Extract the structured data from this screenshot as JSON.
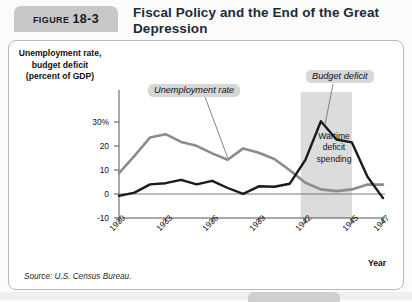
{
  "figure": {
    "badge_word": "FIGURE",
    "badge_number": "18-3",
    "title": "Fiscal Policy and the End of the Great Depression",
    "source": "Source: U.S. Census Bureau."
  },
  "annotations": {
    "unemployment_label": "Unemployment rate",
    "deficit_label": "Budget deficit",
    "band_line1": "Wartime",
    "band_line2": "deficit",
    "band_line3": "spending"
  },
  "colors": {
    "unemployment_line": "#8c8c8c",
    "deficit_line": "#1a1a1a",
    "band_fill": "#dcdcdc",
    "callout_bg": "#d7d7d7",
    "badge_bg": "#c8c8c8",
    "title_text": "#1b2a3a",
    "panel_border": "#b9b9b9",
    "axis": "#555555"
  },
  "chart_data": {
    "type": "line",
    "title": "Fiscal Policy and the End of the Great Depression",
    "xlabel": "Year",
    "ylabel": "Unemployment rate, budget deficit (percent of GDP)",
    "ylabel_lines": [
      "Unemployment rate,",
      "budget deficit",
      "(percent of GDP)"
    ],
    "xlim": [
      1930,
      1947
    ],
    "ylim": [
      -10,
      33
    ],
    "yticks": [
      -10,
      0,
      10,
      20,
      30
    ],
    "ytick_labels": [
      "-10",
      "0",
      "10",
      "20",
      "30%"
    ],
    "xticks": [
      1930,
      1933,
      1936,
      1939,
      1942,
      1945,
      1947
    ],
    "xtick_labels": [
      "1930",
      "1933",
      "1936",
      "1939",
      "1942",
      "1945",
      "1947"
    ],
    "grid": false,
    "legend_position": "inline-annotations",
    "shaded_region": {
      "label": "Wartime deficit spending",
      "x_start": 1941.7,
      "x_end": 1945.0
    },
    "x": [
      1930,
      1931,
      1932,
      1933,
      1934,
      1935,
      1936,
      1937,
      1938,
      1939,
      1940,
      1941,
      1942,
      1943,
      1944,
      1945,
      1946,
      1947
    ],
    "series": [
      {
        "name": "Unemployment rate",
        "color": "#8c8c8c",
        "values": [
          8.7,
          15.9,
          23.6,
          24.9,
          21.7,
          20.1,
          16.9,
          14.3,
          19.0,
          17.2,
          14.6,
          9.9,
          4.7,
          1.9,
          1.2,
          1.9,
          3.9,
          3.9
        ]
      },
      {
        "name": "Budget deficit",
        "color": "#1a1a1a",
        "values": [
          -0.8,
          0.6,
          4.0,
          4.5,
          5.9,
          4.0,
          5.5,
          2.5,
          0.1,
          3.2,
          3.0,
          4.3,
          14.2,
          30.3,
          22.7,
          21.5,
          7.2,
          -1.7
        ]
      }
    ]
  }
}
